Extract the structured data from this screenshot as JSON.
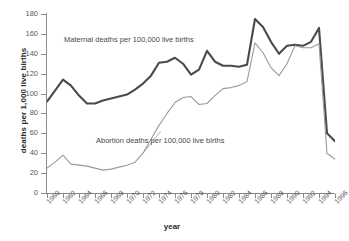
{
  "axes": {
    "ylabel": "deaths per 1,000 live births",
    "xlabel": "year",
    "yticks": [
      0,
      20,
      40,
      60,
      80,
      100,
      120,
      140,
      160,
      180
    ],
    "xticks": [
      1960,
      1962,
      1964,
      1966,
      1968,
      1970,
      1972,
      1974,
      1976,
      1978,
      1980,
      1982,
      1984,
      1986,
      1988,
      1990,
      1992,
      1994,
      1996
    ]
  },
  "annotations": {
    "maternal": "Maternal deaths per 100,000 live births",
    "abortion": "Abortion deaths per 100,000 live births"
  },
  "colors": {
    "maternal_line": "#4a4a4a",
    "abortion_line": "#9a9a9a",
    "axis": "#8a8a8a",
    "background": "#ffffff"
  },
  "chart_data": {
    "type": "line",
    "title": "",
    "xlabel": "year",
    "ylabel": "deaths per 1,000 live births",
    "xlim": [
      1960,
      1996
    ],
    "ylim": [
      0,
      180
    ],
    "grid": false,
    "legend_position": "inline-annotation",
    "x": [
      1960,
      1961,
      1962,
      1963,
      1964,
      1965,
      1966,
      1967,
      1968,
      1969,
      1970,
      1971,
      1972,
      1973,
      1974,
      1975,
      1976,
      1977,
      1978,
      1979,
      1980,
      1981,
      1982,
      1983,
      1984,
      1985,
      1986,
      1987,
      1988,
      1989,
      1990,
      1991,
      1992,
      1993,
      1994,
      1995,
      1996
    ],
    "series": [
      {
        "name": "Maternal deaths per 100,000 live births",
        "color": "#4a4a4a",
        "width": 2.1,
        "values": [
          92,
          103,
          114,
          108,
          98,
          90,
          90,
          93,
          95,
          97,
          99,
          104,
          110,
          118,
          131,
          132,
          136,
          130,
          119,
          124,
          143,
          132,
          128,
          128,
          127,
          129,
          175,
          167,
          152,
          140,
          148,
          149,
          148,
          152,
          166,
          60,
          52
        ]
      },
      {
        "name": "Abortion deaths per 100,000 live births",
        "color": "#9a9a9a",
        "width": 1.1,
        "values": [
          25,
          31,
          38,
          29,
          28,
          27,
          25,
          23,
          24,
          26,
          28,
          31,
          40,
          54,
          68,
          80,
          91,
          96,
          97,
          89,
          90,
          98,
          105,
          106,
          108,
          112,
          151,
          141,
          126,
          118,
          130,
          148,
          146,
          146,
          150,
          40,
          34
        ]
      }
    ],
    "series_note": "values sampled yearly; sharp decline after 1989 for both series, ending near 43 (maternal) and 24 (abortion) in 1996"
  }
}
